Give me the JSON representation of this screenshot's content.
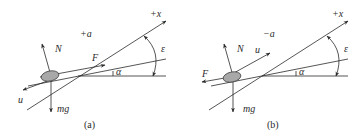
{
  "figure": {
    "panels": [
      {
        "id": "a",
        "caption": "(a)",
        "labels": {
          "acceleration": "+a",
          "axis": "+x",
          "normal_force": "N",
          "applied_force": "F",
          "velocity": "u",
          "weight": "mg",
          "incline_angle": "α",
          "axis_angle": "ε"
        }
      },
      {
        "id": "b",
        "caption": "(b)",
        "labels": {
          "acceleration": "−a",
          "axis": "+x",
          "normal_force": "N",
          "applied_force": "F",
          "velocity": "u",
          "weight": "mg",
          "incline_angle": "α",
          "axis_angle": "ε"
        }
      }
    ],
    "colors": {
      "line": "#2a2a2a",
      "body_fill": "#a8a8a8",
      "background": "#ffffff"
    }
  }
}
